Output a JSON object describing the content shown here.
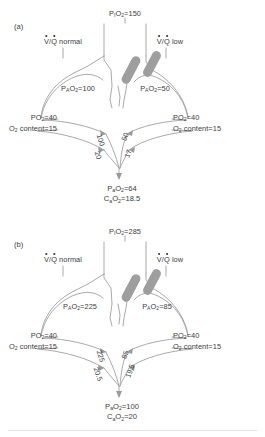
{
  "figure": {
    "type": "physiology-diagram",
    "line_color": "#9a9a9a",
    "text_color": "#3c3c3c",
    "obstruction_color": "#9e9e9e"
  },
  "panels": [
    {
      "tag": "(a)",
      "inspired": {
        "label_prefix": "P",
        "label_sub": "I",
        "label_suffix": "O",
        "label_sub2": "2",
        "value": "150",
        "text": "PIO2 = 150"
      },
      "left_unit": {
        "vq_label": "normal",
        "vq_prefix": "V/Q",
        "alveolar_text": "PAO2 = 100",
        "alveolar_value": "100",
        "venous_po2": "PO2 = 40",
        "venous_po2_value": "40",
        "venous_content": "O2 content = 15",
        "venous_content_value": "15",
        "end_capillary_po2": "100",
        "end_capillary_content": "20"
      },
      "right_unit": {
        "vq_label": "low",
        "vq_prefix": "V/Q",
        "alveolar_text": "PAO2 = 50",
        "alveolar_value": "50",
        "venous_po2": "PO2 = 40",
        "venous_po2_value": "40",
        "venous_content": "O2 content = 15",
        "venous_content_value": "15",
        "end_capillary_po2": "50",
        "end_capillary_content": "17"
      },
      "result": {
        "arterial_po2": "PaO2 = 64",
        "arterial_po2_value": "64",
        "arterial_content": "CaO2 = 18.5",
        "arterial_content_value": "18.5"
      }
    },
    {
      "tag": "(b)",
      "inspired": {
        "label_prefix": "P",
        "label_sub": "I",
        "label_suffix": "O",
        "label_sub2": "2",
        "value": "285",
        "text": "PIO2 = 285"
      },
      "left_unit": {
        "vq_label": "normal",
        "vq_prefix": "V/Q",
        "alveolar_text": "PAO2 = 225",
        "alveolar_value": "225",
        "venous_po2": "PO2 = 40",
        "venous_po2_value": "40",
        "venous_content": "O2 content = 15",
        "venous_content_value": "15",
        "end_capillary_po2": "225",
        "end_capillary_content": "20.5"
      },
      "right_unit": {
        "vq_label": "low",
        "vq_prefix": "V/Q",
        "alveolar_text": "PAO2 = 85",
        "alveolar_value": "85",
        "venous_po2": "PO2 = 40",
        "venous_po2_value": "40",
        "venous_content": "O2 content = 15",
        "venous_content_value": "15",
        "end_capillary_po2": "85",
        "end_capillary_content": "19.5"
      },
      "result": {
        "arterial_po2": "PaO2 = 100",
        "arterial_po2_value": "100",
        "arterial_content": "CaO2 = 20",
        "arterial_content_value": "20"
      }
    }
  ],
  "static_labels": {
    "equals": "=",
    "po2": "PO",
    "o2_content": "O",
    "content_word": " content",
    "two": "2"
  }
}
